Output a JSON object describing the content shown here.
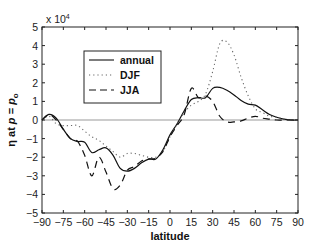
{
  "chart_data": {
    "type": "line",
    "title": "",
    "xlabel": "latitude",
    "ylabel": "η at p = p_o",
    "y_multiplier": "x 10^4",
    "xlim": [
      -90,
      90
    ],
    "ylim": [
      -5,
      5
    ],
    "xticks": [
      -90,
      -75,
      -60,
      -45,
      -30,
      -15,
      0,
      15,
      30,
      45,
      60,
      75,
      90
    ],
    "yticks": [
      -5,
      -4,
      -3,
      -2,
      -1,
      0,
      1,
      2,
      3,
      4,
      5
    ],
    "grid": false,
    "zero_line": true,
    "legend": {
      "position": "upper-left-inset",
      "entries": [
        "annual",
        "DJF",
        "JJA"
      ]
    },
    "series": [
      {
        "name": "annual",
        "style": "solid",
        "x": [
          -90,
          -85,
          -80,
          -75,
          -70,
          -65,
          -60,
          -55,
          -50,
          -45,
          -40,
          -35,
          -30,
          -25,
          -20,
          -15,
          -10,
          -5,
          0,
          5,
          10,
          15,
          20,
          25,
          30,
          35,
          40,
          45,
          50,
          55,
          60,
          65,
          70,
          75,
          80,
          85,
          90
        ],
        "values": [
          0.0,
          0.3,
          0.1,
          -0.5,
          -1.0,
          -1.15,
          -1.2,
          -1.75,
          -1.6,
          -1.5,
          -1.9,
          -2.6,
          -2.75,
          -2.6,
          -2.3,
          -2.1,
          -2.1,
          -1.6,
          -0.8,
          -0.2,
          0.5,
          1.1,
          1.2,
          1.2,
          1.7,
          1.75,
          1.6,
          1.35,
          1.05,
          0.85,
          0.8,
          0.55,
          0.3,
          0.15,
          0.05,
          0.0,
          0.0
        ]
      },
      {
        "name": "DJF",
        "style": "dotted",
        "x": [
          -90,
          -85,
          -80,
          -75,
          -70,
          -65,
          -60,
          -55,
          -50,
          -45,
          -40,
          -35,
          -30,
          -25,
          -20,
          -15,
          -10,
          -5,
          0,
          5,
          10,
          15,
          20,
          25,
          30,
          35,
          40,
          45,
          50,
          55,
          60,
          65,
          70,
          75,
          80,
          85,
          90
        ],
        "values": [
          0.0,
          0.2,
          -0.2,
          -0.3,
          -0.3,
          -0.3,
          -0.6,
          -0.9,
          -1.1,
          -1.4,
          -1.7,
          -2.0,
          -1.8,
          -1.8,
          -1.9,
          -2.0,
          -2.0,
          -1.7,
          -0.9,
          -0.2,
          0.4,
          0.8,
          1.0,
          1.4,
          2.6,
          4.1,
          4.2,
          3.5,
          2.3,
          1.3,
          0.6,
          0.4,
          0.2,
          0.15,
          0.05,
          0.0,
          0.0
        ]
      },
      {
        "name": "JJA",
        "style": "dashed",
        "x": [
          -90,
          -85,
          -80,
          -75,
          -70,
          -65,
          -60,
          -55,
          -50,
          -45,
          -40,
          -35,
          -30,
          -25,
          -20,
          -15,
          -10,
          -5,
          0,
          5,
          10,
          15,
          20,
          25,
          30,
          35,
          40,
          45,
          50,
          55,
          60,
          65,
          70,
          75,
          80,
          85,
          90
        ],
        "values": [
          0.0,
          0.3,
          0.0,
          -0.5,
          -1.0,
          -1.15,
          -1.9,
          -3.0,
          -2.0,
          -2.8,
          -3.7,
          -3.5,
          -2.7,
          -2.5,
          -2.2,
          -2.1,
          -2.05,
          -1.7,
          -0.9,
          -0.3,
          0.3,
          1.7,
          1.2,
          1.3,
          1.0,
          0.2,
          -0.1,
          -0.1,
          -0.05,
          0.1,
          0.2,
          0.1,
          0.05,
          0.0,
          0.0,
          0.0,
          0.0
        ]
      }
    ]
  },
  "labels": {
    "xlabel": "latitude",
    "ylabel_main": "η at ",
    "ylabel_p": "p",
    "ylabel_eq": " = ",
    "ylabel_po": "p",
    "ylabel_sub": "o",
    "multiplier_base": "x 10",
    "multiplier_exp": "4"
  },
  "colors": {
    "axis": "#222222",
    "line": "#111111",
    "zero_line": "#999999",
    "dotted": "#666666"
  }
}
